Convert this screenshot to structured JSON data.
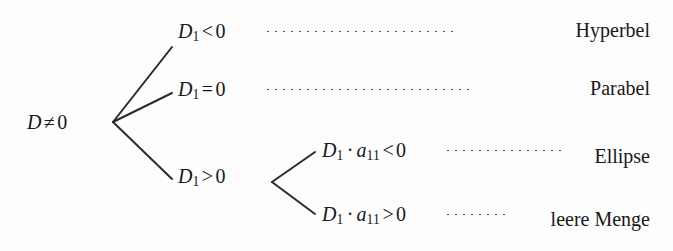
{
  "diagram": {
    "language": "de",
    "type": "decision-tree",
    "background_color": "#fdfdfd",
    "ink_color": "#181818",
    "leader_color": "#4a4a4a",
    "root": {
      "symbol": "D",
      "relation": "≠",
      "value": "0",
      "text": "D ≠ 0"
    },
    "level1": [
      {
        "id": "d1-lt-0",
        "symbol": "D",
        "subscript": "1",
        "relation": "<",
        "value": "0",
        "text": "D1 < 0"
      },
      {
        "id": "d1-eq-0",
        "symbol": "D",
        "subscript": "1",
        "relation": "=",
        "value": "0",
        "text": "D1 = 0"
      },
      {
        "id": "d1-gt-0",
        "symbol": "D",
        "subscript": "1",
        "relation": ">",
        "value": "0",
        "text": "D1 > 0"
      }
    ],
    "level2": [
      {
        "id": "d1a11-lt-0",
        "symbol": "D",
        "subscript": "1",
        "operator": "·",
        "symbol2": "a",
        "subscript2": "11",
        "relation": "<",
        "value": "0",
        "text": "D1 · a11 < 0"
      },
      {
        "id": "d1a11-gt-0",
        "symbol": "D",
        "subscript": "1",
        "operator": "·",
        "symbol2": "a",
        "subscript2": "11",
        "relation": ">",
        "value": "0",
        "text": "D1 · a11 > 0"
      }
    ],
    "leaves": [
      {
        "id": "hyperbel",
        "label": "Hyperbel"
      },
      {
        "id": "parabel",
        "label": "Parabel"
      },
      {
        "id": "ellipse",
        "label": "Ellipse"
      },
      {
        "id": "leere-menge",
        "label": "leere Menge"
      }
    ]
  }
}
